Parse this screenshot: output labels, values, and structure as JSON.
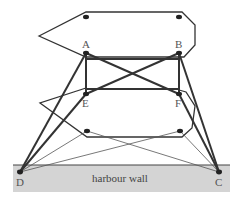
{
  "diagram": {
    "type": "mooring-diagram",
    "colors": {
      "line": "#333333",
      "thin_line": "#555555",
      "wall_fill": "#d4d4d4",
      "wall_edge": "#444444",
      "point": "#222222",
      "label": "#555555"
    },
    "wall_label": "harbour wall",
    "points": {
      "A": {
        "label": "A",
        "x": 86,
        "y": 53
      },
      "B": {
        "label": "B",
        "x": 179,
        "y": 53
      },
      "E": {
        "label": "E",
        "x": 86,
        "y": 94
      },
      "F": {
        "label": "F",
        "x": 179,
        "y": 94
      },
      "D": {
        "label": "D",
        "x": 20,
        "y": 172
      },
      "C": {
        "label": "C",
        "x": 219,
        "y": 172
      }
    },
    "upper_boat_dots": [
      {
        "x": 86,
        "y": 17
      },
      {
        "x": 179,
        "y": 17
      }
    ],
    "lower_boat_dots": [
      {
        "x": 87,
        "y": 131
      },
      {
        "x": 180,
        "y": 131
      }
    ],
    "thick_lines": [
      "AB",
      "AE",
      "BF",
      "EF",
      "AF",
      "BE",
      "AD",
      "BC",
      "ED",
      "FC"
    ],
    "thin_lines": [
      "lower-left-dot to D",
      "lower-left-dot to C",
      "lower-right-dot to D",
      "lower-right-dot to C"
    ]
  }
}
